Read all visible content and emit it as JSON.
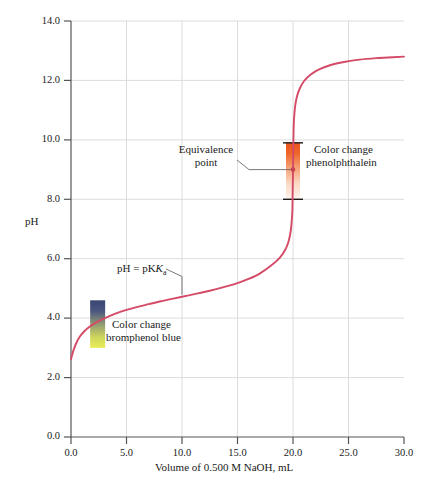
{
  "chart_data": {
    "type": "line",
    "title": "",
    "xlabel": "Volume of 0.500 M NaOH, mL",
    "ylabel": "pH",
    "xlim": [
      0.0,
      30.0
    ],
    "ylim": [
      0.0,
      14.0
    ],
    "xticks": [
      "0.0",
      "5.0",
      "10.0",
      "15.0",
      "20.0",
      "25.0",
      "30.0"
    ],
    "xtick_values": [
      0.0,
      5.0,
      10.0,
      15.0,
      20.0,
      25.0,
      30.0
    ],
    "yticks": [
      "0.0",
      "2.0",
      "4.0",
      "6.0",
      "8.0",
      "10.0",
      "12.0",
      "14.0"
    ],
    "ytick_values": [
      0.0,
      2.0,
      4.0,
      6.0,
      8.0,
      10.0,
      12.0,
      14.0
    ],
    "grid": true,
    "legend": "none",
    "series": [
      {
        "name": "Titration curve",
        "color": "#d44a67",
        "x": [
          0.0,
          0.25,
          0.5,
          0.8,
          1.2,
          1.7,
          2.3,
          3.0,
          4.0,
          5.0,
          6.0,
          7.0,
          8.0,
          9.0,
          10.0,
          11.0,
          12.0,
          13.0,
          14.0,
          15.0,
          16.0,
          17.0,
          18.0,
          18.8,
          19.3,
          19.6,
          19.8,
          19.9,
          19.95,
          20.0,
          20.05,
          20.1,
          20.2,
          20.35,
          20.6,
          21.0,
          21.6,
          22.4,
          23.4,
          24.6,
          26.0,
          27.5,
          29.0,
          30.0
        ],
        "y": [
          2.62,
          2.95,
          3.18,
          3.38,
          3.56,
          3.72,
          3.86,
          3.99,
          4.15,
          4.28,
          4.38,
          4.47,
          4.56,
          4.64,
          4.72,
          4.8,
          4.88,
          4.97,
          5.07,
          5.18,
          5.32,
          5.5,
          5.76,
          6.03,
          6.3,
          6.58,
          6.95,
          7.35,
          7.7,
          9.0,
          10.3,
          10.75,
          11.15,
          11.45,
          11.72,
          11.98,
          12.2,
          12.38,
          12.52,
          12.62,
          12.7,
          12.75,
          12.78,
          12.8
        ]
      }
    ],
    "annotations": [
      {
        "name": "equivalence-point",
        "text_line1": "Equivalence",
        "text_line2": "point",
        "point_x": 20.0,
        "point_y": 9.0
      },
      {
        "name": "phenolphthalein-range",
        "text_line1": "Color change",
        "text_line2": "phenolphthalein",
        "range_low": 8.0,
        "range_high": 9.9,
        "at_x": 20.0,
        "color_top": "#ef5a22",
        "color_bottom": "#fdf3ec"
      },
      {
        "name": "bromphenol-blue-range",
        "text_line1": "Color change",
        "text_line2": "bromphenol blue",
        "range_low": 3.0,
        "range_high": 4.6,
        "at_x": 2.4,
        "color_top": "#3b4a76",
        "color_bottom": "#e8e84e"
      },
      {
        "name": "pka-marker",
        "text": "pH = pK",
        "text_sub": "a",
        "point_x": 10.0,
        "point_y": 4.72
      }
    ]
  },
  "axis": {
    "y_label": "pH",
    "x_label": "Volume of 0.500 M NaOH, mL"
  },
  "labels": {
    "equivalence_line1": "Equivalence",
    "equivalence_line2": "point",
    "phenolphthalein_line1": "Color change",
    "phenolphthalein_line2": "phenolphthalein",
    "bromphenol_line1": "Color change",
    "bromphenol_line2": "bromphenol blue",
    "pka_text": "pH = pK",
    "pka_sub": "a"
  },
  "colors": {
    "curve": "#d44a67",
    "grid": "#d9d9d9",
    "axis": "#4d4d4d",
    "text": "#1a1a1a"
  }
}
